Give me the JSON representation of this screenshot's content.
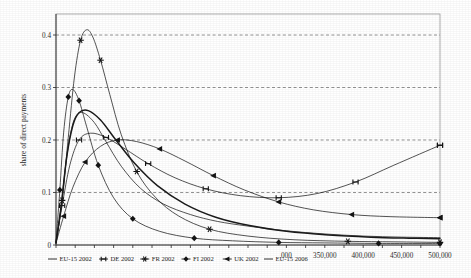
{
  "chart_data": {
    "type": "line",
    "title": "",
    "subtitle": "",
    "xlabel": "",
    "ylabel": "share of direct payments",
    "xlim": [
      0,
      500000
    ],
    "ylim": [
      0,
      0.44
    ],
    "grid": "horizontal-dashed",
    "legend_position": "bottom",
    "y_ticks": [
      "0",
      "0.1",
      "0.2",
      "0.3",
      "0.4"
    ],
    "y_tick_values": [
      0,
      0.1,
      0.2,
      0.3,
      0.4
    ],
    "x_ticks_visible": [
      "000",
      "350,000",
      "400,000",
      "450,000",
      "500,000"
    ],
    "x_tick_values_visible": [
      300000,
      350000,
      400000,
      450000,
      500000
    ],
    "x_tick_step": 25000,
    "note_x_axis": "left-hand x tick labels are hidden behind the legend box",
    "series": [
      {
        "name": "EU-15 2002",
        "marker": "none",
        "weight": "thin",
        "x": [
          0,
          6000,
          12000,
          18000,
          25000,
          35000,
          50000,
          65000,
          85000,
          110000,
          140000,
          175000,
          210000,
          250000,
          300000,
          350000,
          400000,
          450000,
          500000
        ],
        "values": [
          0.004,
          0.065,
          0.145,
          0.205,
          0.243,
          0.252,
          0.233,
          0.197,
          0.15,
          0.108,
          0.078,
          0.058,
          0.045,
          0.036,
          0.027,
          0.021,
          0.017,
          0.015,
          0.014
        ]
      },
      {
        "name": "DE 2002",
        "marker": "dumbbell",
        "weight": "thin",
        "x": [
          0,
          8000,
          18000,
          30000,
          45000,
          65000,
          90000,
          120000,
          155000,
          195000,
          240000,
          290000,
          340000,
          390000,
          440000,
          500000
        ],
        "values": [
          0.006,
          0.075,
          0.152,
          0.2,
          0.213,
          0.205,
          0.183,
          0.155,
          0.128,
          0.107,
          0.094,
          0.09,
          0.098,
          0.12,
          0.152,
          0.19
        ]
      },
      {
        "name": "FR 2002",
        "marker": "star",
        "weight": "thin",
        "x": [
          0,
          8000,
          16000,
          24000,
          32000,
          40000,
          48000,
          58000,
          70000,
          85000,
          105000,
          130000,
          160000,
          200000,
          250000,
          310000,
          380000,
          440000,
          500000
        ],
        "values": [
          0.003,
          0.085,
          0.205,
          0.32,
          0.39,
          0.41,
          0.396,
          0.352,
          0.287,
          0.21,
          0.14,
          0.09,
          0.055,
          0.03,
          0.017,
          0.01,
          0.007,
          0.006,
          0.005
        ]
      },
      {
        "name": "FI 2002",
        "marker": "diamond",
        "weight": "thin",
        "x": [
          0,
          5000,
          10000,
          16000,
          22000,
          30000,
          40000,
          55000,
          75000,
          100000,
          135000,
          180000,
          230000,
          290000,
          350000,
          420000,
          500000
        ],
        "values": [
          0.005,
          0.105,
          0.215,
          0.282,
          0.296,
          0.275,
          0.225,
          0.152,
          0.09,
          0.05,
          0.026,
          0.013,
          0.008,
          0.005,
          0.004,
          0.003,
          0.003
        ]
      },
      {
        "name": "UK 2002",
        "marker": "triangle-left",
        "weight": "thin",
        "x": [
          0,
          10000,
          22000,
          38000,
          58000,
          80000,
          105000,
          135000,
          168000,
          205000,
          245000,
          290000,
          335000,
          385000,
          435000,
          500000
        ],
        "values": [
          0.004,
          0.055,
          0.11,
          0.158,
          0.188,
          0.2,
          0.197,
          0.183,
          0.16,
          0.132,
          0.105,
          0.082,
          0.067,
          0.058,
          0.054,
          0.052
        ]
      },
      {
        "name": "EU-15 2006",
        "marker": "none",
        "weight": "thick",
        "x": [
          0,
          7000,
          14000,
          22000,
          30000,
          42000,
          58000,
          78000,
          102000,
          132000,
          168000,
          208000,
          252000,
          300000,
          355000,
          410000,
          460000,
          500000
        ],
        "values": [
          0.004,
          0.078,
          0.168,
          0.228,
          0.252,
          0.256,
          0.238,
          0.2,
          0.156,
          0.113,
          0.078,
          0.053,
          0.037,
          0.026,
          0.019,
          0.015,
          0.013,
          0.012
        ]
      }
    ],
    "legend_entries": [
      {
        "label": "EU-15 2002",
        "marker": "none",
        "weight": "thin"
      },
      {
        "label": "DE 2002",
        "marker": "dumbbell",
        "weight": "thin"
      },
      {
        "label": "FR 2002",
        "marker": "star",
        "weight": "thin"
      },
      {
        "label": "FI 2002",
        "marker": "diamond",
        "weight": "thin"
      },
      {
        "label": "UK 2002",
        "marker": "triangle-left",
        "weight": "thin"
      },
      {
        "label": "EU-15 2006",
        "marker": "none",
        "weight": "thick"
      }
    ]
  }
}
